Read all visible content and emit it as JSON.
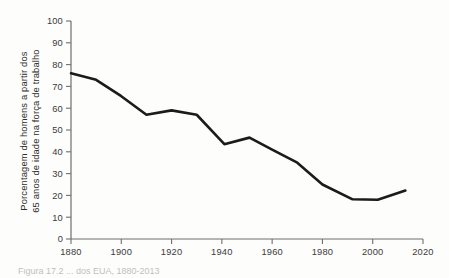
{
  "figure": {
    "background_color": "#fdfdfc",
    "line_color": "#1b1b1b",
    "axis_color": "#6f6f6f",
    "text_color": "#2b2b2b",
    "caption_partial": "Figura    17.2  ...  dos  EUA, 1880-2013"
  },
  "axis_title": {
    "y_line1": "Porcentagem de homens a partir dos",
    "y_line2": "65 anos de idade na força de trabalho"
  },
  "chart_data": {
    "type": "line",
    "title": "",
    "subtitle": "",
    "xlabel": "",
    "ylabel": "Porcentagem de homens a partir dos 65 anos de idade na força de trabalho",
    "xlim": [
      1880,
      2020
    ],
    "ylim": [
      0,
      100
    ],
    "xticks": [
      1880,
      1900,
      1920,
      1940,
      1960,
      1980,
      2000,
      2020
    ],
    "xtick_labels": [
      "1880",
      "1900",
      "1920",
      "1940",
      "1960",
      "1980",
      "2000",
      "2020"
    ],
    "yticks": [
      0,
      10,
      20,
      30,
      40,
      50,
      60,
      70,
      80,
      90,
      100
    ],
    "ytick_labels": [
      "0",
      "10",
      "20",
      "30",
      "40",
      "50",
      "60",
      "70",
      "80",
      "90",
      "100"
    ],
    "grid": false,
    "legend": false,
    "legend_position": "none",
    "series": [
      {
        "name": "Porcentagem de homens 65+ na força de trabalho",
        "color": "#1b1b1b",
        "x": [
          1880,
          1890,
          1900,
          1910,
          1920,
          1930,
          1941,
          1951,
          1960,
          1970,
          1980,
          1992,
          2002,
          2013
        ],
        "values": [
          76.0,
          73.0,
          65.5,
          57.0,
          59.0,
          57.0,
          43.5,
          46.5,
          41.0,
          35.0,
          25.0,
          18.2,
          18.0,
          22.2
        ]
      }
    ]
  }
}
